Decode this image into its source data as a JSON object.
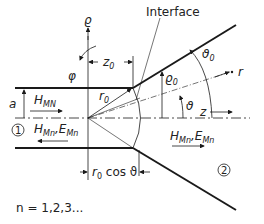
{
  "labels": {
    "interface": "Interface",
    "rho": "ϱ",
    "phi": "φ",
    "z0": "z",
    "z0_sub": "0",
    "r0": "r",
    "r0_sub": "0",
    "rho0": "ϱ",
    "rho0_sub": "0",
    "theta0": "ϑ",
    "theta0_sub": "0",
    "theta": "ϑ",
    "r": "r",
    "z": "z",
    "a": "a",
    "h_mn_main": "H",
    "h_mn_sub": "MN",
    "region1_fields": "H",
    "region1_fields_sub1": "Mn",
    "region1_fields_mid": ",E",
    "region1_fields_sub2": "Mn",
    "region2_fields": "H",
    "region2_fields_sub1": "Mn",
    "region2_fields_mid": ",E",
    "region2_fields_sub2": "Mn",
    "region1": "1",
    "region2": "2",
    "r0cos_r": "r",
    "r0cos_sub": "0",
    "r0cos_rest": " cos ϑ",
    "n_values": "n = 1,2,3..."
  },
  "colors": {
    "line": "#1a1a1a",
    "background": "#ffffff"
  }
}
